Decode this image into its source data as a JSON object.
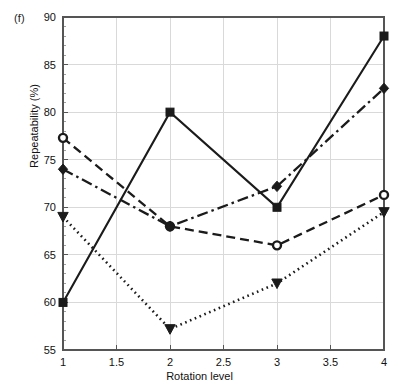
{
  "figure": {
    "panel_label": "(f)",
    "ylabel": "Repeatability (%)",
    "xlabel": "Rotation level"
  },
  "chart_data": {
    "type": "line",
    "title": "",
    "xlabel": "Rotation level",
    "ylabel": "Repeatability (%)",
    "xlim": [
      1,
      4
    ],
    "ylim": [
      55,
      90
    ],
    "xticks": [
      1,
      1.5,
      2,
      2.5,
      3,
      3.5,
      4
    ],
    "xtick_labels": [
      "1",
      "1.5",
      "2",
      "2.5",
      "3",
      "3.5",
      "4"
    ],
    "yticks": [
      55,
      60,
      65,
      70,
      75,
      80,
      85,
      90
    ],
    "ytick_labels": [
      "55",
      "60",
      "65",
      "70",
      "75",
      "80",
      "85",
      "90"
    ],
    "grid": true,
    "legend": "none",
    "x": [
      1,
      2,
      3,
      4
    ],
    "series": [
      {
        "name": "series-square-solid",
        "marker": "square",
        "linestyle": "solid",
        "color": "#1b1b1b",
        "values": [
          60.0,
          80.0,
          70.0,
          88.0
        ]
      },
      {
        "name": "series-circle-dashed",
        "marker": "circle",
        "linestyle": "dashed",
        "color": "#1b1b1b",
        "values": [
          77.3,
          68.0,
          66.0,
          71.3
        ]
      },
      {
        "name": "series-diamond-dashdot",
        "marker": "diamond",
        "linestyle": "dashdot",
        "color": "#1b1b1b",
        "values": [
          74.0,
          68.0,
          72.2,
          82.5
        ]
      },
      {
        "name": "series-triangle-dotted",
        "marker": "triangle-down",
        "linestyle": "dotted",
        "color": "#1b1b1b",
        "values": [
          69.0,
          57.2,
          62.0,
          69.5
        ]
      }
    ]
  }
}
